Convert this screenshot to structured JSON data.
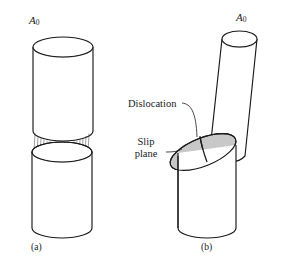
{
  "figure": {
    "domain_note": "materials-science-slip-deformation-diagram",
    "background_color": "#ffffff",
    "line_color": "#1a1a1a",
    "slip_plane_fill": "#c8c8c8",
    "panels": [
      {
        "id": "a",
        "caption": "(a)",
        "area_label": "A",
        "area_subscript": "0",
        "description": "upright cylinder split into upper and lower halves with hatched shear striations between them"
      },
      {
        "id": "b",
        "caption": "(b)",
        "area_label": "A",
        "area_subscript": "0",
        "description": "cylinder after slip: upper portion displaced laterally along an inclined elliptical slip plane"
      }
    ],
    "annotations": [
      {
        "name": "dislocation",
        "text": "Dislocation",
        "lines": [
          "Dislocation"
        ]
      },
      {
        "name": "slip-plane",
        "text": "Slip plane",
        "lines": [
          "Slip",
          "plane"
        ]
      }
    ]
  }
}
